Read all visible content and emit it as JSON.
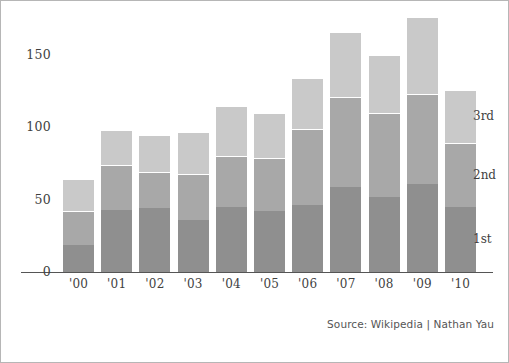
{
  "chart_data": {
    "type": "bar",
    "subtype": "stacked-bar",
    "title": "",
    "subtitle": "",
    "xlabel": "",
    "ylabel": "",
    "categories": [
      "'00",
      "'01",
      "'02",
      "'03",
      "'04",
      "'05",
      "'06",
      "'07",
      "'08",
      "'09",
      "'10"
    ],
    "series": [
      {
        "name": "1st",
        "color": "#8f8f8f",
        "values": [
          19,
          43,
          44,
          36,
          45,
          42,
          46,
          59,
          52,
          61,
          45
        ]
      },
      {
        "name": "2nd",
        "color": "#a8a8a8",
        "values": [
          23,
          31,
          25,
          32,
          35,
          37,
          53,
          62,
          58,
          62,
          44
        ]
      },
      {
        "name": "3rd",
        "color": "#c9c9c9",
        "values": [
          22,
          24,
          26,
          29,
          35,
          31,
          35,
          45,
          40,
          53,
          37
        ]
      }
    ],
    "totals": [
      64,
      98,
      95,
      97,
      115,
      110,
      134,
      166,
      150,
      176,
      126
    ],
    "yticks": [
      0,
      50,
      100,
      150
    ],
    "ylim": [
      0,
      188
    ],
    "grid": false,
    "legend_position": "right-inline-last-bar",
    "annotations": [
      {
        "text": "3rd",
        "series": "3rd"
      },
      {
        "text": "2nd",
        "series": "2nd"
      },
      {
        "text": "1st",
        "series": "1st"
      }
    ],
    "caption": "Source: Wikipedia | Nathan Yau"
  },
  "caption": {
    "text": "Source: Wikipedia | Nathan Yau"
  }
}
